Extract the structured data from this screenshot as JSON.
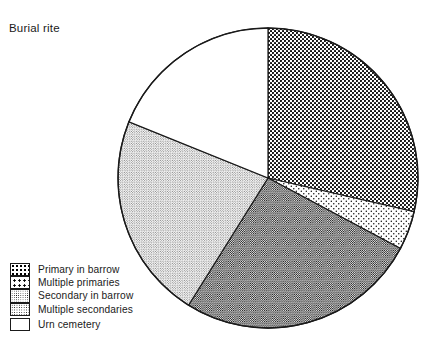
{
  "chart_title": "Burial rite",
  "chart_data": {
    "type": "pie",
    "title": "Burial rite",
    "xlabel": "",
    "ylabel": "",
    "legend_position": "bottom-left",
    "grid": false,
    "start_angle_deg": 0,
    "direction": "clockwise",
    "center": {
      "x": 268,
      "y": 178
    },
    "radius": 150,
    "categories": [
      "Primary in barrow",
      "Multiple primaries",
      "Secondary in barrow",
      "Multiple secondaries",
      "Urn cemetery"
    ],
    "values": [
      28.6,
      4.2,
      26.1,
      22.2,
      18.9
    ],
    "slices": [
      {
        "label": "Primary in barrow",
        "percent": 28.6,
        "start_deg": 0,
        "end_deg": 103,
        "fill": "dense-checker",
        "swatch_class": "sw-dense"
      },
      {
        "label": "Multiple primaries",
        "percent": 4.2,
        "start_deg": 103,
        "end_deg": 118,
        "fill": "sparse-dots",
        "swatch_class": "sw-sparse"
      },
      {
        "label": "Secondary in barrow",
        "percent": 26.1,
        "start_deg": 118,
        "end_deg": 212,
        "fill": "medium-gray-dots",
        "swatch_class": "sw-mid"
      },
      {
        "label": "Multiple secondaries",
        "percent": 22.2,
        "start_deg": 212,
        "end_deg": 292,
        "fill": "light-gray-dots",
        "swatch_class": "sw-light"
      },
      {
        "label": "Urn cemetery",
        "percent": 18.9,
        "start_deg": 292,
        "end_deg": 360,
        "fill": "white",
        "swatch_class": "sw-white"
      }
    ],
    "colors": {
      "outline": "#1a1a1a",
      "background": "#ffffff",
      "pattern_ink": "#000000"
    }
  },
  "legend": {
    "items": [
      {
        "label": "Primary in barrow"
      },
      {
        "label": "Multiple primaries"
      },
      {
        "label": "Secondary in barrow"
      },
      {
        "label": "Multiple secondaries"
      },
      {
        "label": "Urn cemetery"
      }
    ]
  }
}
